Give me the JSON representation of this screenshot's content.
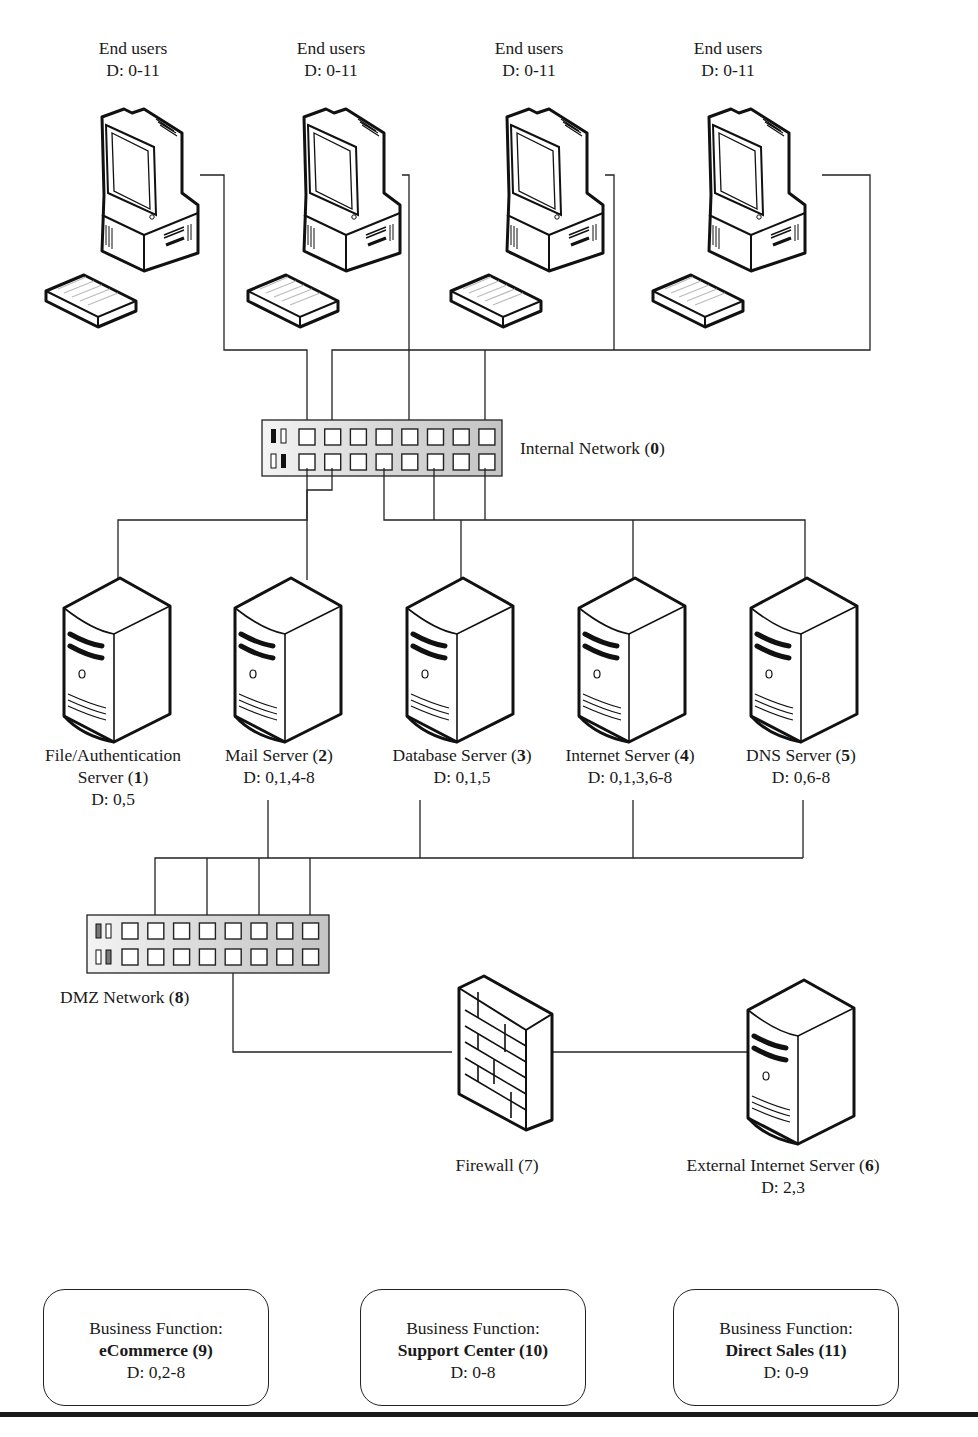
{
  "diagram": {
    "end_users": [
      {
        "name": "End users",
        "d": "D: 0-11"
      },
      {
        "name": "End users",
        "d": "D: 0-11"
      },
      {
        "name": "End users",
        "d": "D: 0-11"
      },
      {
        "name": "End users",
        "d": "D: 0-11"
      }
    ],
    "internal_network": {
      "name": "Internal Network (",
      "id": "0",
      "close": ")"
    },
    "servers": [
      {
        "line1": "File/Authentication",
        "name": "Server (",
        "id": "1",
        "close": ")",
        "d": "D: 0,5"
      },
      {
        "name": "Mail Server (",
        "id": "2",
        "close": ")",
        "d": "D: 0,1,4-8"
      },
      {
        "name": "Database Server (",
        "id": "3",
        "close": ")",
        "d": "D: 0,1,5"
      },
      {
        "name": "Internet Server (",
        "id": "4",
        "close": ")",
        "d": "D: 0,1,3,6-8"
      },
      {
        "name": "DNS Server (",
        "id": "5",
        "close": ")",
        "d": "D: 0,6-8"
      }
    ],
    "dmz_network": {
      "name": "DMZ Network (",
      "id": "8",
      "close": ")"
    },
    "firewall": {
      "name": "Firewall (7)"
    },
    "external_server": {
      "name": "External Internet Server (",
      "id": "6",
      "close": ")",
      "d": "D: 2,3"
    },
    "business_functions": [
      {
        "title": "Business Function:",
        "name": "eCommerce (9)",
        "d": "D: 0,2-8"
      },
      {
        "title": "Business Function:",
        "name": "Support Center (10)",
        "d": "D: 0-8"
      },
      {
        "title": "Business Function:",
        "name": "Direct Sales (11)",
        "d": "D: 0-9"
      }
    ]
  }
}
